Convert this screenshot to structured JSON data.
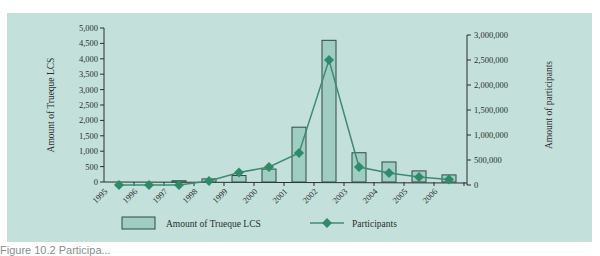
{
  "chart_data": {
    "type": "bar+line",
    "title": "",
    "categories": [
      "1995",
      "1996",
      "1997",
      "1998",
      "1999",
      "2000",
      "2001",
      "2002",
      "2003",
      "2004",
      "2005",
      "2006"
    ],
    "series": [
      {
        "name": "Amount of Trueque LCS",
        "type": "bar",
        "axis": "left",
        "values": [
          0,
          0,
          40,
          100,
          210,
          420,
          1780,
          4600,
          950,
          650,
          360,
          230
        ]
      },
      {
        "name": "Participants",
        "type": "line",
        "axis": "right",
        "values": [
          0,
          0,
          0,
          80000,
          250000,
          360000,
          640000,
          2500000,
          360000,
          240000,
          160000,
          110000
        ]
      }
    ],
    "ylabel_left": "Amount of Trueque LCS",
    "ylabel_right": "Amount of participants",
    "xlabel": "",
    "ylim_left": [
      0,
      5000
    ],
    "ylim_right": [
      0,
      3000000
    ],
    "yticks_left": [
      "0",
      "500",
      "1,000",
      "1,500",
      "2,000",
      "2,500",
      "3,000",
      "3,500",
      "4,000",
      "4,500",
      "5,000"
    ],
    "yticks_right": [
      "0",
      "500,000",
      "1,000,000",
      "1,500,000",
      "2,000,000",
      "2,500,000",
      "3,000,000"
    ],
    "legend": [
      {
        "label": "Amount of Trueque LCS",
        "marker": "rect"
      },
      {
        "label": "Participants",
        "marker": "line-diamond"
      }
    ],
    "legend_position": "bottom",
    "grid": false,
    "colors": {
      "panel_bg": "#c3e1da",
      "bar_fill": "#9fcdc2",
      "bar_stroke": "#2f4a44",
      "line": "#3f8a72",
      "marker": "#2f8a68",
      "axis": "#2a2f2d"
    }
  },
  "caption": "Figure 10.2 Participa..."
}
